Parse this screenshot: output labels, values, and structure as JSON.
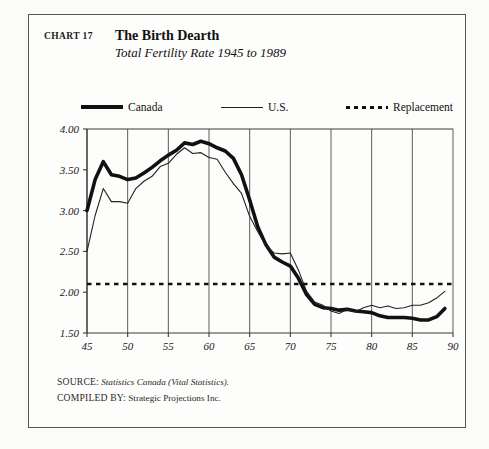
{
  "header": {
    "chart_label": "CHART 17",
    "title": "The Birth Dearth",
    "subtitle": "Total Fertility Rate 1945 to 1989"
  },
  "legend": {
    "items": [
      {
        "label": "Canada",
        "style": "thick",
        "color": "#111111"
      },
      {
        "label": "U.S.",
        "style": "thin",
        "color": "#222222"
      },
      {
        "label": "Replacement",
        "style": "dotted",
        "color": "#111111"
      }
    ]
  },
  "notes": {
    "source_prefix": "SOURCE:",
    "source_text": "Statistics Canada (Vital Statistics).",
    "compiled_prefix": "COMPILED BY:",
    "compiled_text": "Strategic Projections Inc."
  },
  "chart_data": {
    "type": "line",
    "title": "The Birth Dearth",
    "subtitle": "Total Fertility Rate 1945 to 1989",
    "xlabel": "",
    "ylabel": "",
    "xlim": [
      45,
      90
    ],
    "ylim": [
      1.5,
      4.0
    ],
    "xticks": [
      45,
      50,
      55,
      60,
      65,
      70,
      75,
      80,
      85,
      90
    ],
    "yticks": [
      1.5,
      2.0,
      2.5,
      3.0,
      3.5,
      4.0
    ],
    "ytick_labels": [
      "1.50",
      "2.00",
      "2.50",
      "3.00",
      "3.50",
      "4.00"
    ],
    "xtick_labels": [
      "45",
      "50",
      "55",
      "60",
      "65",
      "70",
      "75",
      "80",
      "85",
      "90"
    ],
    "grid": "vertical",
    "legend_position": "above-plot",
    "x": [
      45,
      46,
      47,
      48,
      49,
      50,
      51,
      52,
      53,
      54,
      55,
      56,
      57,
      58,
      59,
      60,
      61,
      62,
      63,
      64,
      65,
      66,
      67,
      68,
      69,
      70,
      71,
      72,
      73,
      74,
      75,
      76,
      77,
      78,
      79,
      80,
      81,
      82,
      83,
      84,
      85,
      86,
      87,
      88,
      89
    ],
    "series": [
      {
        "name": "Canada",
        "style": "thick",
        "color": "#111111",
        "values": [
          3.0,
          3.38,
          3.6,
          3.44,
          3.42,
          3.38,
          3.4,
          3.46,
          3.53,
          3.61,
          3.68,
          3.74,
          3.83,
          3.81,
          3.85,
          3.82,
          3.77,
          3.73,
          3.64,
          3.44,
          3.13,
          2.8,
          2.58,
          2.43,
          2.37,
          2.32,
          2.17,
          1.97,
          1.85,
          1.81,
          1.8,
          1.78,
          1.79,
          1.77,
          1.76,
          1.75,
          1.71,
          1.69,
          1.69,
          1.69,
          1.68,
          1.66,
          1.66,
          1.7,
          1.8
        ]
      },
      {
        "name": "U.S.",
        "style": "thin",
        "color": "#222222",
        "values": [
          2.5,
          2.94,
          3.27,
          3.11,
          3.11,
          3.09,
          3.27,
          3.36,
          3.42,
          3.54,
          3.58,
          3.69,
          3.77,
          3.7,
          3.71,
          3.65,
          3.63,
          3.47,
          3.33,
          3.21,
          2.93,
          2.74,
          2.57,
          2.48,
          2.47,
          2.48,
          2.27,
          2.01,
          1.88,
          1.84,
          1.77,
          1.74,
          1.79,
          1.76,
          1.81,
          1.84,
          1.81,
          1.83,
          1.8,
          1.81,
          1.84,
          1.84,
          1.87,
          1.93,
          2.01
        ]
      },
      {
        "name": "Replacement",
        "style": "dotted",
        "color": "#111111",
        "constant": 2.1
      }
    ]
  }
}
